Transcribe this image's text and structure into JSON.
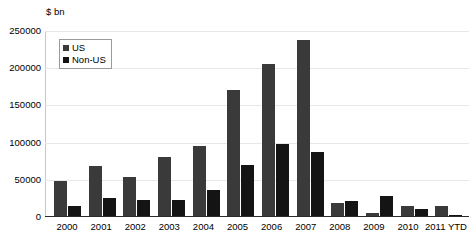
{
  "chart_data": {
    "type": "bar",
    "title": "",
    "subtitle": "",
    "unit_label": "$ bn",
    "xlabel": "",
    "ylabel": "",
    "categories": [
      "2000",
      "2001",
      "2002",
      "2003",
      "2004",
      "2005",
      "2006",
      "2007",
      "2008",
      "2009",
      "2010",
      "2011 YTD"
    ],
    "series": [
      {
        "name": "US",
        "color": "#3a3a3a",
        "values": [
          47000,
          67000,
          52000,
          79000,
          94000,
          170000,
          204000,
          236000,
          17000,
          4000,
          14000,
          13000
        ]
      },
      {
        "name": "Non-US",
        "color": "#141414",
        "values": [
          13000,
          24000,
          22000,
          21000,
          35000,
          69000,
          97000,
          86000,
          20000,
          27000,
          9000,
          1000
        ]
      }
    ],
    "ylim": [
      0,
      250000
    ],
    "yticks": [
      0,
      50000,
      100000,
      150000,
      200000,
      250000
    ],
    "ytick_labels": [
      "0",
      "50000",
      "100000",
      "150000",
      "200000",
      "250000"
    ],
    "grid": true,
    "legend_position": "upper-left-inside"
  },
  "legend": {
    "items": [
      {
        "label": "US"
      },
      {
        "label": "Non-US"
      }
    ]
  }
}
